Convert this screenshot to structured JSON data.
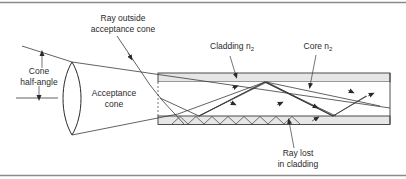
{
  "figure": {
    "type": "optical-fiber-acceptance-cone-diagram",
    "labels": {
      "ray_outside_line1": "Ray outside",
      "ray_outside_line2": "acceptance cone",
      "cone_half_angle_line1": "Cone",
      "cone_half_angle_line2": "half-angle",
      "acceptance_cone_line1": "Acceptance",
      "acceptance_cone_line2": "cone",
      "cladding": "Cladding n",
      "cladding_sub": "2",
      "core": "Core n",
      "core_sub": "2",
      "ray_lost_line1": "Ray lost",
      "ray_lost_line2": "in cladding"
    },
    "colors": {
      "line": "#3a3a3a",
      "cladding_fill": "#e6e6e6",
      "frame": "#8a8a8a",
      "background": "#ffffff"
    }
  }
}
